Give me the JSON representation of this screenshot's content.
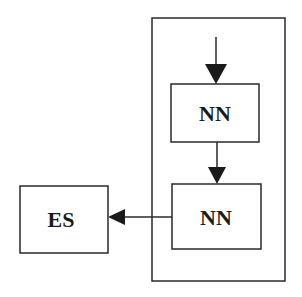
{
  "diagram": {
    "nodes": [
      {
        "id": "nn1",
        "label": "NN"
      },
      {
        "id": "nn2",
        "label": "NN"
      },
      {
        "id": "es",
        "label": "ES"
      }
    ],
    "edges": [
      {
        "from": "input",
        "to": "nn1"
      },
      {
        "from": "nn1",
        "to": "nn2"
      },
      {
        "from": "nn2",
        "to": "es"
      }
    ],
    "container": {
      "contains": [
        "nn1",
        "nn2"
      ]
    },
    "colors": {
      "stroke": "#2a2a2a",
      "background": "#ffffff"
    }
  }
}
